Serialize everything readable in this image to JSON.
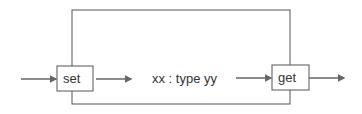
{
  "diagram": {
    "set_label": "set",
    "get_label": "get",
    "center_label": "xx : type yy",
    "stroke_color": "#555555",
    "arrow_color": "#666666"
  }
}
